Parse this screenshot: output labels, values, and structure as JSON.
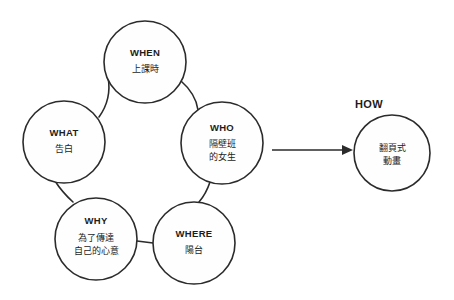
{
  "diagram": {
    "type": "cycle-with-output",
    "background_color": "#ffffff",
    "stroke_color": "#2b2b2b",
    "text_color": "#1c1c1c",
    "cycle_nodes": [
      {
        "id": "when",
        "key": "WHEN",
        "lines": [
          "上課時"
        ],
        "cx": 145,
        "cy": 62,
        "r": 41
      },
      {
        "id": "who",
        "key": "WHO",
        "lines": [
          "隔壁班",
          "的女生"
        ],
        "cx": 222,
        "cy": 143,
        "r": 41
      },
      {
        "id": "where",
        "key": "WHERE",
        "lines": [
          "陽台"
        ],
        "cx": 194,
        "cy": 243,
        "r": 41
      },
      {
        "id": "why",
        "key": "WHY",
        "lines": [
          "為了傳達",
          "自己的心意"
        ],
        "cx": 96,
        "cy": 239,
        "r": 41
      },
      {
        "id": "what",
        "key": "WHAT",
        "lines": [
          "告白"
        ],
        "cx": 64,
        "cy": 142,
        "r": 41
      }
    ],
    "output_node": {
      "id": "how",
      "label": "HOW",
      "label_x": 369,
      "label_y": 108,
      "lines": [
        "翻頁式",
        "動畫"
      ],
      "cx": 392,
      "cy": 153,
      "r": 38
    },
    "arrow": {
      "name": "cycle-to-how-arrow",
      "x1": 272,
      "x2": 348,
      "y": 150
    }
  }
}
